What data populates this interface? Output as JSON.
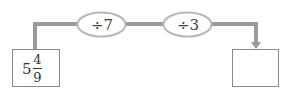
{
  "start": {
    "whole": "5",
    "numerator": "4",
    "denominator": "9"
  },
  "operations": [
    {
      "label": "÷7"
    },
    {
      "label": "÷3"
    }
  ],
  "result": {
    "value": ""
  },
  "colors": {
    "connector": "#9a9a9a",
    "ellipse_stroke": "#b8b8b8",
    "box_border": "#8a8a8a"
  }
}
